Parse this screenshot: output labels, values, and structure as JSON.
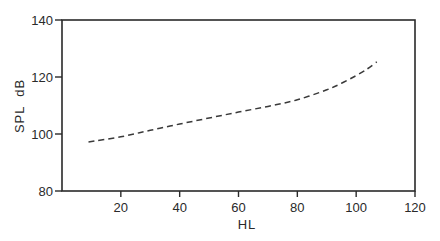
{
  "chart_data": {
    "type": "line",
    "title": "",
    "xlabel": "HL",
    "ylabel": "SPL  dB",
    "xlim": [
      0,
      120
    ],
    "ylim": [
      80,
      140
    ],
    "xticks": [
      20,
      40,
      60,
      80,
      100,
      120
    ],
    "yticks": [
      80,
      100,
      120,
      140
    ],
    "grid": false,
    "legend": null,
    "series": [
      {
        "name": "SPL vs HL",
        "style": "dashed",
        "color": "#3a3a3a",
        "x": [
          9,
          20,
          30,
          40,
          50,
          60,
          70,
          80,
          90,
          95,
          100,
          104,
          107
        ],
        "y": [
          97.2,
          99.0,
          101.3,
          103.5,
          105.6,
          107.7,
          109.7,
          112.0,
          115.5,
          117.8,
          120.5,
          123.0,
          125.3
        ]
      }
    ]
  },
  "layout": {
    "plot_left": 62,
    "plot_right": 415,
    "plot_top": 20,
    "plot_bottom": 191,
    "axis_color": "#2a2a2a"
  }
}
